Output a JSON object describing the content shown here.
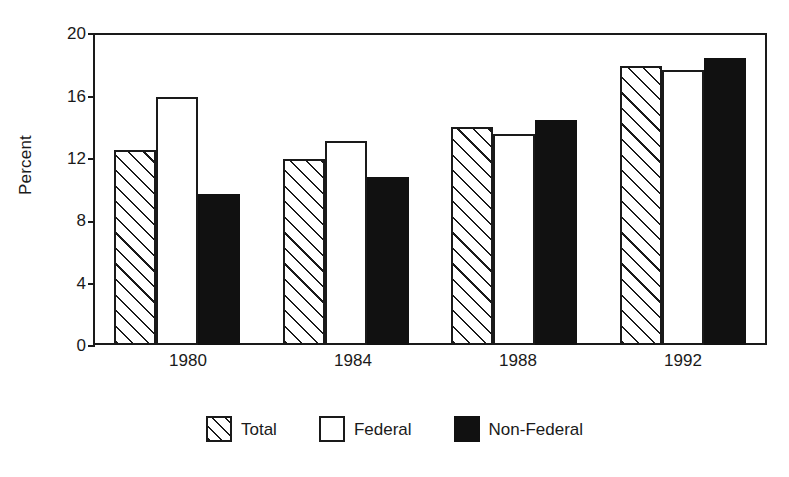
{
  "chart_data": {
    "type": "bar",
    "title": "",
    "xlabel": "",
    "ylabel": "Percent",
    "categories": [
      "1980",
      "1984",
      "1988",
      "1992"
    ],
    "series": [
      {
        "name": "Total",
        "values": [
          12.5,
          11.9,
          14.0,
          17.9
        ]
      },
      {
        "name": "Federal",
        "values": [
          15.9,
          13.1,
          13.5,
          17.6
        ]
      },
      {
        "name": "Non-Federal",
        "values": [
          9.7,
          10.8,
          14.4,
          18.4
        ]
      }
    ],
    "ylim": [
      0,
      20
    ],
    "yticks": [
      0,
      4,
      8,
      12,
      16,
      20
    ],
    "ytick_labels": [
      "0",
      "4",
      "8",
      "12",
      "16",
      "20"
    ],
    "grid": false,
    "legend_position": "bottom"
  },
  "axis": {
    "y_title": "Percent",
    "y_tick_labels": [
      "20",
      "16",
      "12",
      "8",
      "4",
      "0"
    ],
    "x_tick_labels": [
      "1980",
      "1984",
      "1988",
      "1992"
    ]
  },
  "legend": {
    "items": [
      {
        "label": "Total",
        "swatch": "hatched-swatch"
      },
      {
        "label": "Federal",
        "swatch": "outline-swatch"
      },
      {
        "label": "Non-Federal",
        "swatch": "filled-swatch"
      }
    ]
  },
  "colors": {
    "foreground": "#1a1a1a",
    "background": "#ffffff",
    "filled_series": "#111111"
  }
}
